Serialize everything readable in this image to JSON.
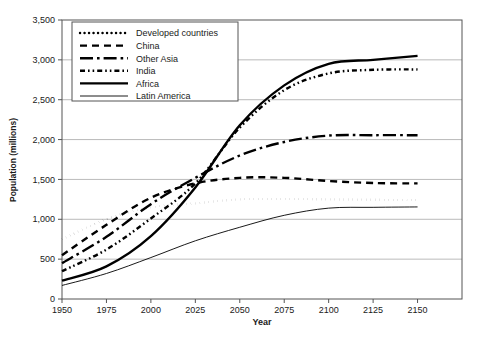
{
  "chart_data": {
    "type": "line",
    "title": "",
    "xlabel": "Year",
    "ylabel": "Population (millions)",
    "xlim": [
      1950,
      2175
    ],
    "ylim": [
      0,
      3500
    ],
    "grid": true,
    "legend_position": "top-left",
    "xticks": [
      "1950",
      "1975",
      "2000",
      "2025",
      "2050",
      "2075",
      "2100",
      "2125",
      "2150"
    ],
    "yticks": [
      "0",
      "500",
      "1,000",
      "1,500",
      "2,000",
      "2,500",
      "3,000",
      "3,500"
    ],
    "x": [
      1950,
      1975,
      2000,
      2025,
      2050,
      2075,
      2100,
      2125,
      2150
    ],
    "series": [
      {
        "name": "Developed countries",
        "style": "dotted",
        "values": [
          750,
          1000,
          1150,
          1200,
          1250,
          1255,
          1250,
          1245,
          1240
        ]
      },
      {
        "name": "China",
        "style": "dashed",
        "values": [
          550,
          930,
          1270,
          1450,
          1520,
          1520,
          1480,
          1455,
          1450
        ]
      },
      {
        "name": "Other Asia",
        "style": "dash-dot-long",
        "values": [
          450,
          780,
          1190,
          1520,
          1800,
          1970,
          2050,
          2055,
          2055
        ]
      },
      {
        "name": "India",
        "style": "dash-dot-dot",
        "values": [
          350,
          620,
          1010,
          1450,
          2150,
          2620,
          2830,
          2875,
          2880
        ]
      },
      {
        "name": "Africa",
        "style": "solid-thick",
        "values": [
          230,
          410,
          790,
          1400,
          2180,
          2680,
          2950,
          3000,
          3050
        ]
      },
      {
        "name": "Latin America",
        "style": "solid-thin",
        "values": [
          170,
          320,
          520,
          730,
          900,
          1050,
          1140,
          1150,
          1155
        ]
      }
    ]
  },
  "legend": {
    "entries": [
      {
        "label": "Developed countries"
      },
      {
        "label": "China"
      },
      {
        "label": "Other Asia"
      },
      {
        "label": "India"
      },
      {
        "label": "Africa"
      },
      {
        "label": "Latin America"
      }
    ]
  },
  "colors": {
    "line": "#000000",
    "grid": "#a8a8a8",
    "frame": "#555555",
    "text": "#1a1a1a",
    "background": "#ffffff"
  }
}
